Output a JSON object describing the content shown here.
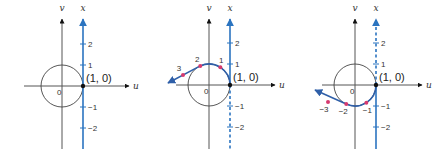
{
  "colors": {
    "axis": "#555555",
    "number_line": "#2b74c0",
    "wrap_curve": "#2f5fa8",
    "point": "#d63a6f",
    "origin_point": "#111111",
    "circle": "#444444"
  },
  "unit_px": 21,
  "panels": [
    {
      "id": "panel-1",
      "origin": [
        62,
        86
      ],
      "u_axis": {
        "from_x": 24,
        "to_x": 129,
        "label": "u"
      },
      "v_axis": {
        "top_y": 19,
        "bottom_y": 149,
        "label": "v"
      },
      "x_line": {
        "label": "x",
        "dashed_above": false,
        "dashed_below": false
      },
      "origin_label": "0",
      "point_label": "(1, 0)",
      "ticks": [
        {
          "value": 2,
          "label": "2"
        },
        {
          "value": 1,
          "label": "1"
        },
        {
          "value": -1,
          "label": "−1"
        },
        {
          "value": -2,
          "label": "−2"
        }
      ],
      "wrap": null
    },
    {
      "id": "panel-2",
      "origin": [
        209,
        85
      ],
      "u_axis": {
        "from_x": 176,
        "to_x": 275,
        "label": "u"
      },
      "v_axis": {
        "top_y": 19,
        "bottom_y": 149,
        "label": "v"
      },
      "x_line": {
        "label": "x",
        "dashed_above": false,
        "dashed_below": true
      },
      "origin_label": "0",
      "point_label": "(1, 0)",
      "ticks": [
        {
          "value": 2,
          "label": "2"
        },
        {
          "value": 1,
          "label": "1"
        },
        {
          "value": -1,
          "label": "−1"
        },
        {
          "value": -2,
          "label": "−2"
        }
      ],
      "wrap": {
        "direction": "counterclockwise",
        "points": [
          {
            "t": 1,
            "label": "1"
          },
          {
            "t": 2,
            "label": "2"
          },
          {
            "t": 3,
            "label": "3",
            "pos": [
              183,
              75
            ]
          }
        ],
        "arrow_tip": [
          168,
          83
        ]
      }
    },
    {
      "id": "panel-3",
      "origin": [
        355,
        85
      ],
      "u_axis": {
        "from_x": 322,
        "to_x": 422,
        "label": "u"
      },
      "v_axis": {
        "top_y": 19,
        "bottom_y": 149,
        "label": "v"
      },
      "x_line": {
        "label": "x",
        "dashed_above": true,
        "dashed_below": false
      },
      "origin_label": "0",
      "point_label": "(1, 0)",
      "ticks": [
        {
          "value": 2,
          "label": "2"
        },
        {
          "value": 1,
          "label": "1"
        },
        {
          "value": -1,
          "label": "−1"
        },
        {
          "value": -2,
          "label": "−2"
        }
      ],
      "wrap": {
        "direction": "clockwise",
        "points": [
          {
            "t": -1,
            "label": "−1"
          },
          {
            "t": -2,
            "label": "−2"
          },
          {
            "t": -3,
            "label": "−3",
            "pos": [
              328,
              102
            ]
          }
        ],
        "arrow_tip": [
          315,
          90
        ]
      }
    }
  ]
}
